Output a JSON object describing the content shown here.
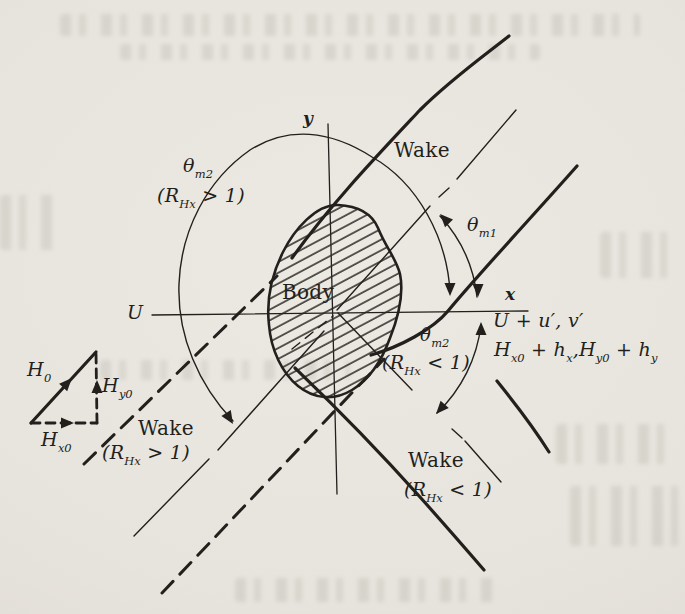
{
  "figure": {
    "ink_color": "#221f1c",
    "paper_color": "#e8e5df",
    "labels": {
      "axis_y": {
        "text": "y"
      },
      "axis_x": {
        "text": "x"
      },
      "velocity": {
        "text": "U"
      },
      "body": {
        "text": "Body"
      },
      "wake_top": {
        "text": "Wake"
      },
      "wake_lower_left": {
        "text": "Wake"
      },
      "wake_lower_right": {
        "text": "Wake"
      },
      "theta_m2_upper": {
        "runs": [
          {
            "t": "θ"
          },
          {
            "s": "m2"
          }
        ]
      },
      "cond_upper": {
        "runs": [
          {
            "t": "(R"
          },
          {
            "s": "Hx"
          },
          {
            "t": " > 1)"
          }
        ]
      },
      "theta_m1": {
        "runs": [
          {
            "t": "θ"
          },
          {
            "s": "m1"
          }
        ]
      },
      "theta_m2_right": {
        "runs": [
          {
            "t": "θ"
          },
          {
            "s": "m2"
          }
        ]
      },
      "cond_right": {
        "runs": [
          {
            "t": "(R"
          },
          {
            "s": "Hx"
          },
          {
            "t": " < 1)"
          }
        ]
      },
      "cond_lower_left": {
        "runs": [
          {
            "t": "(R"
          },
          {
            "s": "Hx"
          },
          {
            "t": " > 1)"
          }
        ]
      },
      "cond_lower_right": {
        "runs": [
          {
            "t": "(R"
          },
          {
            "s": "Hx"
          },
          {
            "t": " < 1)"
          }
        ]
      },
      "flow_perturbed": {
        "text": "U + u′, v′"
      },
      "field_perturbed": {
        "runs": [
          {
            "t": "H"
          },
          {
            "s": "x0"
          },
          {
            "t": " + h"
          },
          {
            "s": "x"
          },
          {
            "t": ",H"
          },
          {
            "s": "y0"
          },
          {
            "t": " + h"
          },
          {
            "s": "y"
          }
        ]
      },
      "h0": {
        "runs": [
          {
            "t": "H"
          },
          {
            "s": "0"
          }
        ]
      },
      "hy0": {
        "runs": [
          {
            "t": "H"
          },
          {
            "s": "y0"
          }
        ]
      },
      "hx0": {
        "runs": [
          {
            "t": "H"
          },
          {
            "s": "x0"
          }
        ]
      }
    }
  }
}
